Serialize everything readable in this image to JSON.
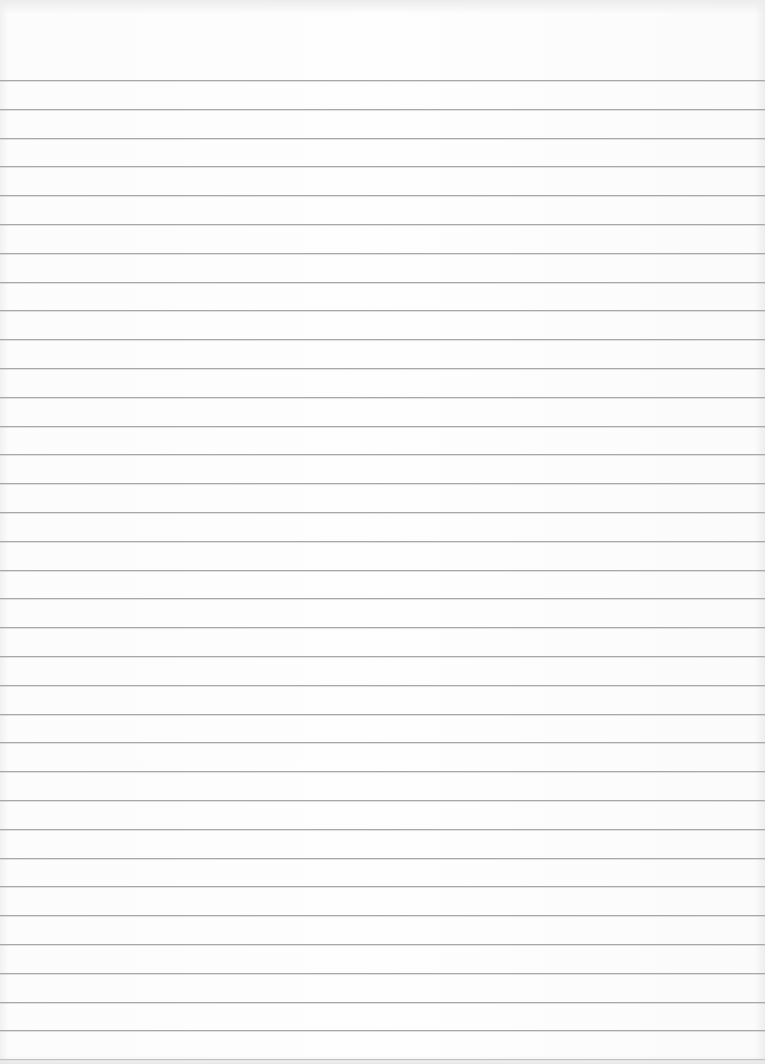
{
  "paper": {
    "type": "ruled notebook paper",
    "line_count": 35,
    "first_line_y": 80,
    "line_spacing": 28.8,
    "line_color": "#a8a8a8",
    "background_color": "#fdfdfd",
    "text": ""
  }
}
